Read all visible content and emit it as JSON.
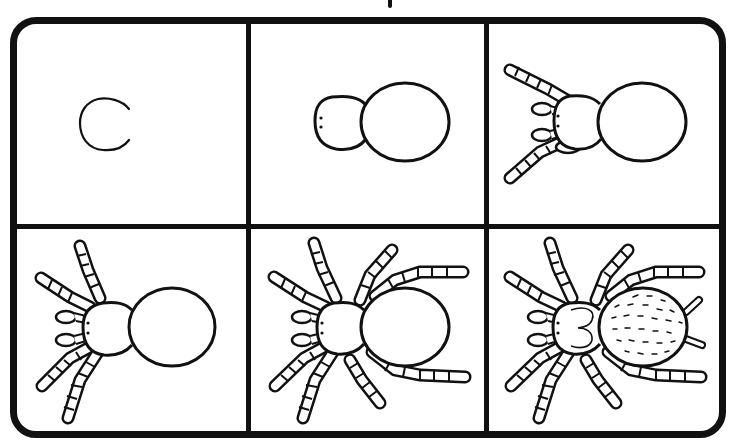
{
  "colors": {
    "line": "#111111",
    "background": "#ffffff"
  },
  "grid": {
    "rows": 2,
    "columns": 3
  },
  "steps": [
    {
      "number": 1,
      "label": "Step 1",
      "content": "Draw a C shape for the head"
    },
    {
      "number": 2,
      "label": "Step 2",
      "content": "Add a large oval abdomen and two eye dots"
    },
    {
      "number": 3,
      "label": "Step 3",
      "content": "Add two front legs and two palps"
    },
    {
      "number": 4,
      "label": "Step 4",
      "content": "Add two more legs on the left side"
    },
    {
      "number": 5,
      "label": "Step 5",
      "content": "Add the remaining legs wrapping around the body"
    },
    {
      "number": 6,
      "label": "Step 6",
      "content": "Add a 3-shaped marking on the head, hair dashes on the abdomen, and spinnerets"
    }
  ]
}
